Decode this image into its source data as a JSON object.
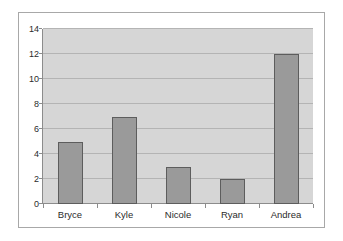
{
  "chart_data": {
    "type": "bar",
    "title": "",
    "xlabel": "",
    "ylabel": "",
    "categories": [
      "Bryce",
      "Kyle",
      "Nicole",
      "Ryan",
      "Andrea"
    ],
    "values": [
      5,
      7,
      3,
      2,
      12
    ],
    "ylim": [
      0,
      14
    ],
    "yticks": [
      0,
      2,
      4,
      6,
      8,
      10,
      12,
      14
    ],
    "ytick_labels": [
      "0",
      "2",
      "4",
      "6",
      "8",
      "10",
      "12",
      "14"
    ],
    "grid": true,
    "legend": false,
    "colors": {
      "bar_fill": "#9a9a9a",
      "bar_border": "#5d5d5d",
      "plot_background": "#d6d6d6",
      "gridline": "#b4b4b4",
      "axis": "#8c8c8c",
      "chart_border": "#a8a8a8",
      "text": "#2b2b2b"
    }
  }
}
